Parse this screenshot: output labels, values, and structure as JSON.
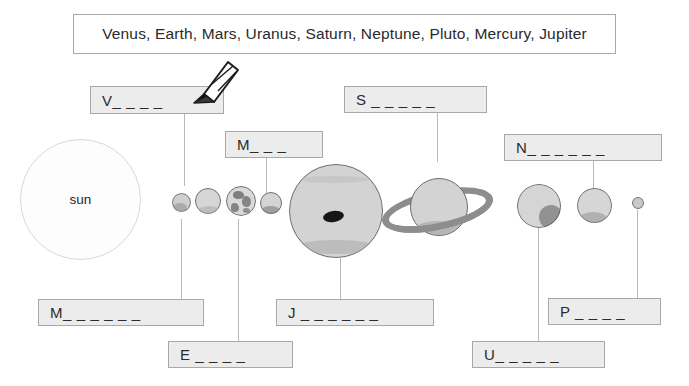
{
  "worksheet": {
    "title": "Solar System Planet Labeling Worksheet",
    "word_bank": {
      "text": "Venus, Earth, Mars, Uranus, Saturn, Neptune, Pluto, Mercury, Jupiter",
      "words": [
        "Venus",
        "Earth",
        "Mars",
        "Uranus",
        "Saturn",
        "Neptune",
        "Pluto",
        "Mercury",
        "Jupiter"
      ]
    },
    "sun": {
      "label": "sun"
    },
    "answers": [
      {
        "id": "venus",
        "initial": "V",
        "blanks": "_ _ _ _",
        "text": "V_ _ _ _"
      },
      {
        "id": "mars",
        "initial": "M",
        "blanks": "_ _ _",
        "text": "M_ _ _"
      },
      {
        "id": "saturn",
        "initial": "S",
        "blanks": "_ _ _ _ _",
        "text": "S _ _ _ _ _"
      },
      {
        "id": "neptune",
        "initial": "N",
        "blanks": "_ _ _ _ _ _",
        "text": "N_ _ _ _ _ _"
      },
      {
        "id": "mercury",
        "initial": "M",
        "blanks": "_ _ _ _ _ _",
        "text": "M_ _ _ _ _ _"
      },
      {
        "id": "jupiter",
        "initial": "J",
        "blanks": "_ _ _ _ _ _",
        "text": "J _ _ _ _ _ _"
      },
      {
        "id": "earth",
        "initial": "E",
        "blanks": "_ _ _ _",
        "text": "E _ _ _ _"
      },
      {
        "id": "pluto",
        "initial": "P",
        "blanks": "_ _ _ _",
        "text": "P _ _ _ _"
      },
      {
        "id": "uranus",
        "initial": "U",
        "blanks": "_ _ _ _ _",
        "text": "U_ _ _ _ _"
      }
    ],
    "planets": [
      {
        "id": "mercury",
        "name": "Mercury"
      },
      {
        "id": "venus",
        "name": "Venus"
      },
      {
        "id": "earth",
        "name": "Earth"
      },
      {
        "id": "mars",
        "name": "Mars"
      },
      {
        "id": "jupiter",
        "name": "Jupiter"
      },
      {
        "id": "saturn",
        "name": "Saturn"
      },
      {
        "id": "uranus",
        "name": "Uranus"
      },
      {
        "id": "neptune",
        "name": "Neptune"
      },
      {
        "id": "pluto",
        "name": "Pluto"
      }
    ],
    "cursor": {
      "icon": "pencil-icon"
    },
    "colors": {
      "box_border": "#a8a8a8",
      "box_fill": "#ececec",
      "word_bank_fill": "#ffffff",
      "planet_fill": "#d3d3d3",
      "planet_outline": "#6d6d6d",
      "connector": "#b9b9b9",
      "text": "#2a2a2a"
    }
  }
}
